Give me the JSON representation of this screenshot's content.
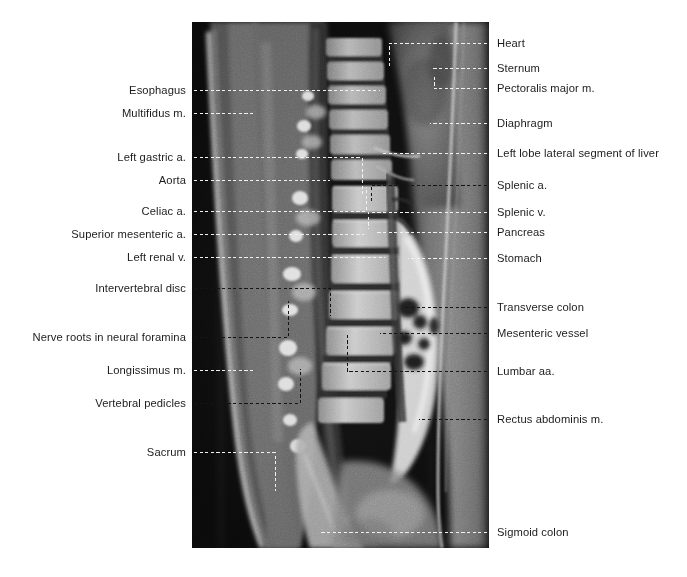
{
  "figure": {
    "type": "annotated-mri",
    "modality": "Sagittal MRI",
    "region": "Thoracolumbar spine and abdomen",
    "image_box": {
      "x": 192,
      "y": 22,
      "width": 297,
      "height": 526
    },
    "colors": {
      "page_background": "#ffffff",
      "label_text": "#1c1c1c",
      "leader_line": "#f2f2f2",
      "leader_line_dark": "#141414",
      "image_background": "#070707"
    }
  },
  "labels": {
    "left": [
      {
        "id": "esophagus",
        "text": "Esophagus",
        "y": 90,
        "tip_x": 380,
        "elbow": null,
        "line_style": "light"
      },
      {
        "id": "multifidus-m",
        "text": "Multifidus m.",
        "y": 113,
        "tip_x": 255,
        "elbow": null,
        "line_style": "light"
      },
      {
        "id": "left-gastric-a",
        "text": "Left gastric a.",
        "y": 157,
        "tip_x": 362,
        "elbow": {
          "x": 362,
          "y": 196
        },
        "line_style": "light"
      },
      {
        "id": "aorta",
        "text": "Aorta",
        "y": 180,
        "tip_x": 330,
        "elbow": null,
        "line_style": "light"
      },
      {
        "id": "celiac-a",
        "text": "Celiac a.",
        "y": 211,
        "tip_x": 366,
        "elbow": {
          "x": 366,
          "y": 186
        },
        "line_style": "light"
      },
      {
        "id": "superior-mesenteric-a",
        "text": "Superior mesenteric a.",
        "y": 234,
        "tip_x": 364,
        "elbow": null,
        "line_style": "light"
      },
      {
        "id": "left-renal-v",
        "text": "Left renal v.",
        "y": 257,
        "tip_x": 385,
        "elbow": null,
        "line_style": "light"
      },
      {
        "id": "intervertebral-disc",
        "text": "Intervertebral disc",
        "y": 288,
        "tip_x": 330,
        "elbow": {
          "x": 330,
          "y": 315
        },
        "line_style": "dark"
      },
      {
        "id": "nerve-roots-neural-foramina",
        "text": "Nerve roots in neural foramina",
        "y": 337,
        "tip_x": 288,
        "elbow": {
          "x": 288,
          "y": 300
        },
        "line_style": "dark"
      },
      {
        "id": "longissimus-m",
        "text": "Longissimus m.",
        "y": 370,
        "tip_x": 253,
        "elbow": null,
        "line_style": "light"
      },
      {
        "id": "vertebral-pedicles",
        "text": "Vertebral pedicles",
        "y": 403,
        "tip_x": 300,
        "elbow": {
          "x": 300,
          "y": 368
        },
        "line_style": "dark"
      },
      {
        "id": "sacrum",
        "text": "Sacrum",
        "y": 452,
        "tip_x": 320,
        "elbow": {
          "x": 275,
          "y": 490
        },
        "line_style": "light"
      }
    ],
    "right": [
      {
        "id": "heart",
        "text": "Heart",
        "y": 43,
        "tip_x": 389,
        "elbow": {
          "x": 389,
          "y": 65
        },
        "line_style": "light"
      },
      {
        "id": "sternum",
        "text": "Sternum",
        "y": 68,
        "tip_x": 431,
        "elbow": null,
        "line_style": "light"
      },
      {
        "id": "pectoralis-major-m",
        "text": "Pectoralis major m.",
        "y": 88,
        "tip_x": 434,
        "elbow": {
          "x": 434,
          "y": 75
        },
        "line_style": "light"
      },
      {
        "id": "diaphragm",
        "text": "Diaphragm",
        "y": 123,
        "tip_x": 430,
        "elbow": null,
        "line_style": "light"
      },
      {
        "id": "left-lobe-lateral-segment-of-liver",
        "text": "Left lobe lateral segment of liver",
        "y": 153,
        "tip_x": 382,
        "elbow": null,
        "line_style": "light"
      },
      {
        "id": "splenic-a",
        "text": "Splenic a.",
        "y": 185,
        "tip_x": 371,
        "elbow": {
          "x": 371,
          "y": 200
        },
        "line_style": "dark"
      },
      {
        "id": "splenic-v",
        "text": "Splenic v.",
        "y": 212,
        "tip_x": 368,
        "elbow": {
          "x": 368,
          "y": 228
        },
        "line_style": "light"
      },
      {
        "id": "pancreas",
        "text": "Pancreas",
        "y": 232,
        "tip_x": 375,
        "elbow": null,
        "line_style": "light"
      },
      {
        "id": "stomach",
        "text": "Stomach",
        "y": 258,
        "tip_x": 408,
        "elbow": null,
        "line_style": "light"
      },
      {
        "id": "transverse-colon",
        "text": "Transverse colon",
        "y": 307,
        "tip_x": 404,
        "elbow": null,
        "line_style": "dark"
      },
      {
        "id": "mesenteric-vessel",
        "text": "Mesenteric vessel",
        "y": 333,
        "tip_x": 380,
        "elbow": null,
        "line_style": "dark"
      },
      {
        "id": "lumbar-aa",
        "text": "Lumbar aa.",
        "y": 371,
        "tip_x": 347,
        "elbow": {
          "x": 347,
          "y": 333
        },
        "line_style": "dark"
      },
      {
        "id": "rectus-abdominis-m",
        "text": "Rectus abdominis m.",
        "y": 419,
        "tip_x": 419,
        "elbow": null,
        "line_style": "dark"
      },
      {
        "id": "sigmoid-colon",
        "text": "Sigmoid colon",
        "y": 532,
        "tip_x": 320,
        "elbow": null,
        "line_style": "light"
      }
    ]
  },
  "geometry": {
    "left_text_right_edge": 186,
    "left_line_start": 194,
    "right_line_start": 487,
    "right_text_left_edge": 497
  }
}
